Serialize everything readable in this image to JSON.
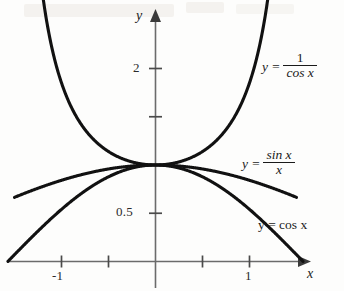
{
  "chart_data": {
    "type": "line",
    "title": "",
    "xlabel": "x",
    "ylabel": "y",
    "xlim": [
      -1.45,
      1.6
    ],
    "ylim": [
      -0.08,
      2.55
    ],
    "grid": false,
    "legend_position": "inline-right",
    "x_ticks": [
      -1,
      -0.5,
      0.5,
      1
    ],
    "x_tick_labels": [
      "-1",
      "",
      "",
      "1"
    ],
    "y_ticks": [
      0.5,
      1.5,
      2
    ],
    "y_tick_labels": [
      "0.5",
      "",
      "2"
    ],
    "annotations": [
      {
        "text": "curves converge at (0, 1)",
        "x": 0,
        "y": 1
      }
    ],
    "series": [
      {
        "name": "y = 1/cos x",
        "expression": "1/cos(x)",
        "label_lines": [
          "y =",
          "1",
          "cos x"
        ],
        "x_range": [
          -1.27,
          1.27
        ],
        "color": "#111111",
        "width": 3.1
      },
      {
        "name": "y = sin x / x",
        "expression": "sin(x)/x",
        "label_lines": [
          "y =",
          "sin x",
          "x"
        ],
        "x_range": [
          -1.5,
          1.5
        ],
        "color": "#111111",
        "width": 3.1
      },
      {
        "name": "y = cos x",
        "expression": "cos(x)",
        "label_lines": [
          "y = cos x"
        ],
        "x_range": [
          -1.57,
          1.57
        ],
        "color": "#111111",
        "width": 3.1
      }
    ]
  },
  "axes": {
    "y_axis_name": "y",
    "x_axis_name": "x",
    "y_tick_2": "2",
    "y_tick_05": "0.5",
    "x_tick_neg1": "-1",
    "x_tick_1": "1"
  },
  "labels": {
    "sec": {
      "lhs": "y =",
      "numerator": "1",
      "denominator": "cos x"
    },
    "sinc": {
      "lhs": "y =",
      "numerator": "sin x",
      "denominator": "x"
    },
    "cos": {
      "text": "y = cos x"
    }
  }
}
